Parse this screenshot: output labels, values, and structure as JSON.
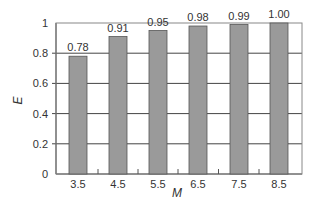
{
  "chart_data": {
    "type": "bar",
    "title": "",
    "xlabel": "M",
    "ylabel": "E",
    "categories": [
      "3.5",
      "4.5",
      "5.5",
      "6.5",
      "7.5",
      "8.5"
    ],
    "values": [
      0.78,
      0.91,
      0.95,
      0.98,
      0.99,
      1.0
    ],
    "data_labels": [
      "0.78",
      "0.91",
      "0.95",
      "0.98",
      "0.99",
      "1.00"
    ],
    "ylim": [
      0,
      1
    ],
    "yticks": [
      "0",
      "0.2",
      "0.4",
      "0.6",
      "0.8",
      "1"
    ],
    "ytick_values": [
      0,
      0.2,
      0.4,
      0.6,
      0.8,
      1
    ],
    "grid": "horizontal",
    "legend": null,
    "colors": {
      "bar_fill": "#9a9a9a",
      "bar_stroke": "#555555",
      "grid": "#444444",
      "frame": "#888888"
    }
  }
}
